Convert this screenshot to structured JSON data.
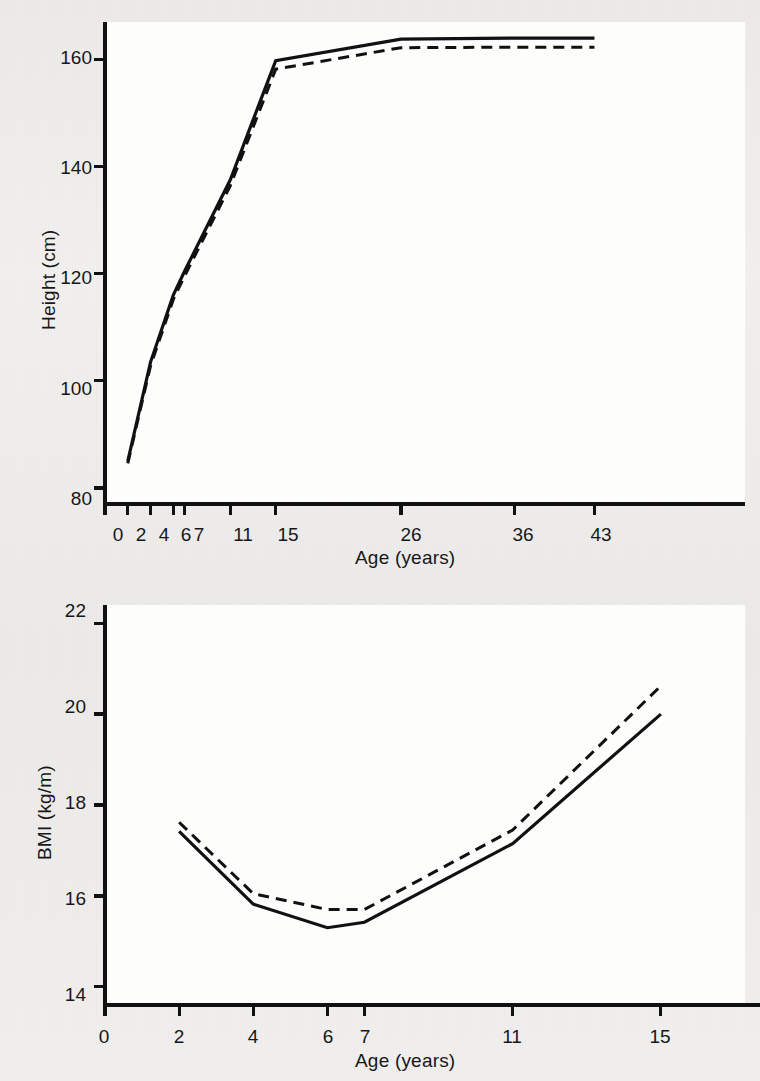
{
  "figure": {
    "background_color": "#eeedeb",
    "ink_color": "#111114",
    "panel_color": "#fdfdfc"
  },
  "panels": [
    {
      "id": "height-panel",
      "name": "height-vs-age-chart"
    },
    {
      "id": "bmi-panel",
      "name": "bmi-vs-age-chart"
    }
  ],
  "chart_data": [
    {
      "type": "line",
      "id": "height-chart",
      "title": "",
      "xlabel": "Age (years)",
      "ylabel": "Height (cm)",
      "x": [
        2,
        4,
        6,
        7,
        11,
        15,
        26,
        36,
        43
      ],
      "xticks": [
        0,
        2,
        4,
        6,
        7,
        11,
        15,
        26,
        36,
        43
      ],
      "xtick_labels": [
        "0",
        "2",
        "4",
        "6",
        "7",
        "11",
        "15",
        "26",
        "36",
        "43"
      ],
      "yticks": [
        80,
        100,
        120,
        140,
        160
      ],
      "ytick_labels": [
        "80",
        "100",
        "120",
        "140",
        "160"
      ],
      "xlim": [
        0,
        47
      ],
      "ylim": [
        77,
        167
      ],
      "grid": false,
      "legend": "none",
      "series": [
        {
          "name": "solid-series",
          "style": "solid",
          "values": [
            85.0,
            103.5,
            116.0,
            120.5,
            137.5,
            159.8,
            163.8,
            164.0,
            164.0
          ]
        },
        {
          "name": "dashed-series",
          "style": "dashed",
          "values": [
            84.6,
            102.8,
            115.2,
            119.6,
            136.4,
            158.2,
            162.2,
            162.3,
            162.3
          ]
        }
      ]
    },
    {
      "type": "line",
      "id": "bmi-chart",
      "title": "",
      "xlabel": "Age (years)",
      "ylabel": "BMI (kg/m)",
      "x": [
        2,
        4,
        6,
        7,
        11,
        15
      ],
      "xticks": [
        0,
        2,
        4,
        6,
        7,
        11,
        15
      ],
      "xtick_labels": [
        "0",
        "2",
        "4",
        "6",
        "7",
        "11",
        "15"
      ],
      "yticks": [
        14,
        16,
        18,
        20,
        22
      ],
      "ytick_labels": [
        "14",
        "16",
        "18",
        "20",
        "22"
      ],
      "xlim": [
        0,
        17
      ],
      "ylim": [
        13.6,
        22.4
      ],
      "grid": false,
      "legend": "none",
      "series": [
        {
          "name": "solid-series",
          "style": "solid",
          "values": [
            17.42,
            15.82,
            15.3,
            15.42,
            17.15,
            20.0
          ]
        },
        {
          "name": "dashed-series",
          "style": "dashed",
          "values": [
            17.62,
            16.05,
            15.7,
            15.7,
            17.45,
            20.62
          ]
        }
      ]
    }
  ]
}
